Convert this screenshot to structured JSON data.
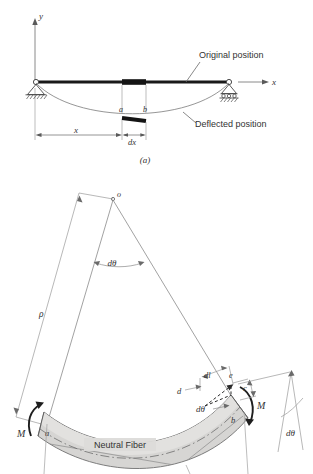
{
  "figure": {
    "caption_a": "(a)",
    "part_a": {
      "axis_y_label": "y",
      "axis_x_label": "x",
      "callout_original": "Original position",
      "callout_deflected": "Deflected position",
      "point_a": "a",
      "point_b": "b",
      "dim_x": "x",
      "dim_dx": "dx"
    },
    "part_b": {
      "center_point": "o",
      "radius_label": "ρ",
      "angle_label_top": "dθ",
      "angle_label_block": "dθ",
      "angle_label_right": "dθ",
      "neutral_fiber": "Neutral Fiber",
      "moment_left": "M",
      "moment_right": "M",
      "point_a": "a",
      "point_b": "b",
      "point_c": "c",
      "point_d": "d",
      "point_e": "e",
      "elong_label": "dl"
    }
  },
  "colors": {
    "ink": "#333333",
    "beam_dark": "#1a1a1a",
    "block_fill": "#d4d4d2",
    "block_fill_light": "#dedddb",
    "thin_line": "#8a8a8a",
    "background": "#ffffff"
  }
}
